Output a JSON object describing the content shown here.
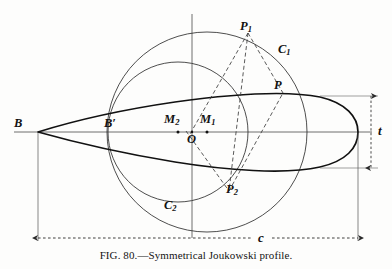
{
  "figure": {
    "caption_prefix": "F",
    "caption_smallcaps": "IG",
    "caption_number": ". 80.—Symmetrical Joukowski profile.",
    "caption_full": "FIG. 80.—Symmetrical Joukowski profile.",
    "title": "Symmetrical Joukowski profile",
    "figure_number": "80"
  },
  "labels": {
    "B": {
      "text": "B",
      "sub": "",
      "x": 14,
      "y": 118
    },
    "Bprime": {
      "text": "B′",
      "sub": "",
      "x": 105,
      "y": 118
    },
    "O": {
      "text": "O",
      "sub": "",
      "x": 189,
      "y": 133
    },
    "M1": {
      "text": "M",
      "sub": "1",
      "x": 200,
      "y": 115
    },
    "M2": {
      "text": "M",
      "sub": "2",
      "x": 165,
      "y": 115
    },
    "P": {
      "text": "P",
      "sub": "",
      "x": 274,
      "y": 80
    },
    "P1": {
      "text": "P",
      "sub": "1",
      "x": 241,
      "y": 22
    },
    "P2": {
      "text": "P",
      "sub": "2",
      "x": 226,
      "y": 184
    },
    "C1": {
      "text": "C",
      "sub": "1",
      "x": 279,
      "y": 45
    },
    "C2": {
      "text": "C",
      "sub": "2",
      "x": 165,
      "y": 200
    },
    "t": {
      "text": "t",
      "sub": "",
      "x": 379,
      "y": 125
    },
    "c": {
      "text": "c",
      "sub": "",
      "x": 259,
      "y": 234
    }
  },
  "dimensions": {
    "chord_label": "c",
    "thickness_label": "t"
  },
  "geometry": {
    "axis_y": 132,
    "axis_x": 192,
    "nose_x": 38,
    "tail_x": 358,
    "circle1": {
      "cx": 207,
      "cy": 132,
      "r": 100,
      "name": "C1"
    },
    "circle2": {
      "cx": 178,
      "cy": 132,
      "r": 70,
      "name": "C2"
    },
    "points": {
      "P1": {
        "x": 248,
        "y": 33
      },
      "P2": {
        "x": 228,
        "y": 190
      },
      "P": {
        "x": 281,
        "y": 92
      }
    }
  },
  "colors": {
    "ink": "#1a1a1a",
    "thin": "#3a3a3a",
    "paper": "#fdfdfc"
  }
}
